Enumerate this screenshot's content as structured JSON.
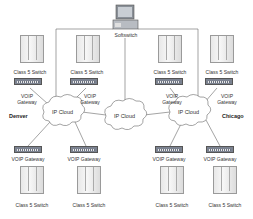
{
  "diagram": {
    "softswitch": {
      "label": "Softswitch",
      "icon": "computer-icon"
    },
    "cities": {
      "left": "Denver",
      "right": "Chicago"
    },
    "clouds": [
      {
        "label": "IP Cloud"
      },
      {
        "label": "IP Cloud"
      },
      {
        "label": "IP Cloud"
      }
    ],
    "top_nodes": [
      {
        "switch_label": "Class 5 Switch",
        "gateway_label_1": "VOIP",
        "gateway_label_2": "Gateway"
      },
      {
        "switch_label": "Class 5 Switch",
        "gateway_label_1": "VOIP",
        "gateway_label_2": "Gateway"
      },
      {
        "switch_label": "Class 5 Switch",
        "gateway_label_1": "VOIP",
        "gateway_label_2": "Gateway"
      },
      {
        "switch_label": "Class 5 Switch",
        "gateway_label_1": "VOIP",
        "gateway_label_2": "Gateway"
      }
    ],
    "bottom_nodes": [
      {
        "gateway_label": "VOIP Gateway",
        "switch_label": "Class 5 Switch"
      },
      {
        "gateway_label": "VOIP Gateway",
        "switch_label": "Class 5 Switch"
      },
      {
        "gateway_label": "VOIP Gateway",
        "switch_label": "Class 5 Switch"
      },
      {
        "gateway_label": "VOIP Gateway",
        "switch_label": "Class 5 Switch"
      }
    ]
  }
}
